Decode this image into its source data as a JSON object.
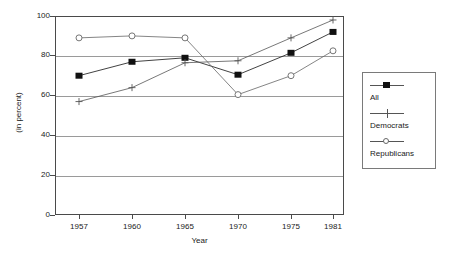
{
  "chart_data": {
    "type": "line",
    "title": "",
    "subtitle": "",
    "xlabel": "Year",
    "ylabel": "(in percent)",
    "categories": [
      "1957",
      "1960",
      "1965",
      "1970",
      "1975",
      "1981"
    ],
    "x": [
      1957,
      1960,
      1965,
      1970,
      1975,
      1981
    ],
    "ylim": [
      0,
      100
    ],
    "ytick_labels": [
      "0",
      "20",
      "40",
      "60",
      "80",
      "100"
    ],
    "yticks": [
      0,
      20,
      40,
      60,
      80,
      100
    ],
    "grid": "horizontal",
    "legend_position": "right-outside",
    "series": [
      {
        "name": "All",
        "marker": "filled-square",
        "color": "#111111",
        "values": [
          70,
          77,
          79,
          70.5,
          81.5,
          92
        ]
      },
      {
        "name": "Democrats",
        "marker": "plus",
        "color": "#555555",
        "values": [
          57,
          64,
          76.5,
          77.5,
          89,
          98
        ]
      },
      {
        "name": "Republicans",
        "marker": "open-circle",
        "color": "#666666",
        "values": [
          89,
          90,
          89,
          60.5,
          70,
          82.5
        ]
      }
    ],
    "annotations": []
  },
  "legend": {
    "entries": [
      {
        "label": "All",
        "marker": "filled-square"
      },
      {
        "label": "Democrats",
        "marker": "plus"
      },
      {
        "label": "Republicans",
        "marker": "open-circle"
      }
    ]
  },
  "colors": {
    "axis": "#4a4a4a",
    "grid": "#9a9a9a",
    "text": "#1a1a1a",
    "background": "#ffffff",
    "legend_border": "#7a7a7a"
  }
}
